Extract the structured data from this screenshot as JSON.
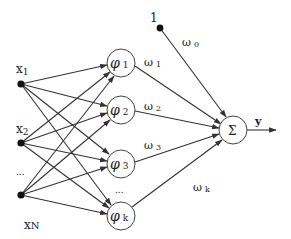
{
  "diagram": {
    "type": "RBF neural network",
    "inputs": [
      {
        "label": "x",
        "sub": "1"
      },
      {
        "label": "x",
        "sub": "2"
      },
      {
        "label": "..."
      },
      {
        "label": "x",
        "sub": "N"
      }
    ],
    "hidden": [
      {
        "label": "φ",
        "sub": "1"
      },
      {
        "label": "φ",
        "sub": "2"
      },
      {
        "label": "φ",
        "sub": "3"
      },
      {
        "label": "..."
      },
      {
        "label": "φ",
        "sub": "k"
      }
    ],
    "bias": {
      "label": "1"
    },
    "weights": [
      {
        "label": "ω",
        "sub": "0"
      },
      {
        "label": "ω",
        "sub": "1"
      },
      {
        "label": "ω",
        "sub": "2"
      },
      {
        "label": "ω",
        "sub": "3"
      },
      {
        "label": "ω",
        "sub": "k"
      }
    ],
    "sum_node": {
      "label": "Σ"
    },
    "output": {
      "label": "y"
    },
    "colors": {
      "stroke": "#333333",
      "node_fill": "#ffffff",
      "dot": "#111111"
    }
  }
}
